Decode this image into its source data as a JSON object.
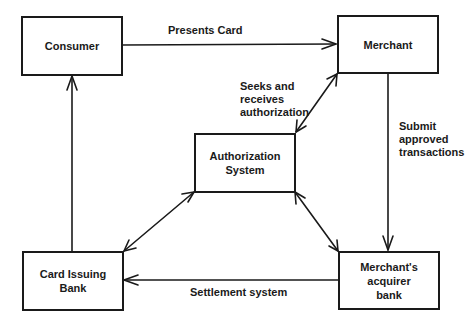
{
  "nodes": {
    "consumer": {
      "label": "Consumer"
    },
    "merchant": {
      "label": "Merchant"
    },
    "authorization_system": {
      "label": "Authorization\nSystem"
    },
    "card_issuing_bank": {
      "label": "Card Issuing\nBank"
    },
    "merchant_acquirer_bank": {
      "label": "Merchant's\nacquirer\nbank"
    }
  },
  "edges": {
    "presents_card": {
      "label": "Presents Card",
      "from": "consumer",
      "to": "merchant",
      "direction": "one-way"
    },
    "seeks_authorization": {
      "label": "Seeks and\nreceives\nauthorization",
      "from": "merchant",
      "to": "authorization_system",
      "direction": "two-way"
    },
    "submit_transactions": {
      "label": "Submit\napproved\ntransactions",
      "from": "merchant",
      "to": "merchant_acquirer_bank",
      "direction": "one-way"
    },
    "settlement_system": {
      "label": "Settlement system",
      "from": "merchant_acquirer_bank",
      "to": "card_issuing_bank",
      "direction": "one-way"
    },
    "issuer_to_consumer": {
      "label": "",
      "from": "card_issuing_bank",
      "to": "consumer",
      "direction": "one-way"
    },
    "auth_issuer": {
      "label": "",
      "from": "authorization_system",
      "to": "card_issuing_bank",
      "direction": "two-way"
    },
    "auth_acquirer": {
      "label": "",
      "from": "authorization_system",
      "to": "merchant_acquirer_bank",
      "direction": "two-way"
    }
  },
  "colors": {
    "stroke": "#1a1a1a",
    "background": "#ffffff"
  }
}
